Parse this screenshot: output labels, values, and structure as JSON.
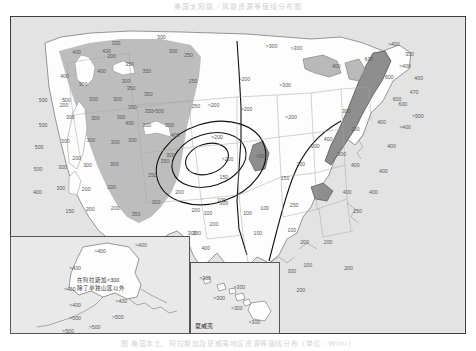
{
  "figure": {
    "title": "美国太阳能／风能资源等值线分布图",
    "caption": "图 美国本土、阿拉斯加及夏威夷地区资源等值线分布（单位：W/m²）",
    "domain_note": "contour map of the contiguous United States with Alaska and Hawaii insets"
  },
  "colors": {
    "ocean": "#e3e3e3",
    "land": "#fdfdfd",
    "shade_light": "#b9b9b9",
    "shade_dark": "#8e8e8e",
    "contour_line": "#1a1a1a",
    "border": "#3c3c3c",
    "state_line": "#9a9a9a",
    "label_text": "#5a5a5a"
  },
  "insets": {
    "alaska": {
      "name": "阿拉斯加",
      "note_line1": "在阿拉斯加<300",
      "note_line2": "除了单独山区以外",
      "labels": [
        {
          "t": ">400",
          "x": 0.5,
          "y": 0.16
        },
        {
          "t": ">400",
          "x": 0.73,
          "y": 0.09
        },
        {
          "t": ">400",
          "x": 0.36,
          "y": 0.33
        },
        {
          "t": ">400",
          "x": 0.33,
          "y": 0.55
        },
        {
          "t": ">400",
          "x": 0.36,
          "y": 0.72
        },
        {
          "t": ">400",
          "x": 0.62,
          "y": 0.68
        },
        {
          "t": ">500",
          "x": 0.36,
          "y": 0.85
        },
        {
          "t": ">500",
          "x": 0.6,
          "y": 0.84
        },
        {
          "t": ">500",
          "x": 0.47,
          "y": 0.95
        },
        {
          "t": ">500",
          "x": 0.32,
          "y": 0.99
        }
      ]
    },
    "hawaii": {
      "name": "夏威夷",
      "labels": [
        {
          "t": ">300",
          "x": 0.16,
          "y": 0.23
        },
        {
          "t": ">300",
          "x": 0.55,
          "y": 0.36
        },
        {
          "t": ">300",
          "x": 0.32,
          "y": 0.52
        },
        {
          "t": ">300",
          "x": 0.52,
          "y": 0.66
        },
        {
          "t": ">300",
          "x": 0.72,
          "y": 0.86
        }
      ]
    }
  },
  "chart_data": {
    "type": "contour-map",
    "title": "美国太阳能／风能资源等值线分布图",
    "unit": "W/m²",
    "region": "Contiguous United States, Alaska, Hawaii",
    "contour_levels": [
      100,
      150,
      200,
      250,
      300,
      350,
      400,
      500
    ],
    "legend_position": "none",
    "grid": false,
    "shaded_classes": [
      {
        "name": "western-mountain-shading",
        "fill": "#b9b9b9",
        "meaning": "western high-resource / mountain region"
      },
      {
        "name": "appalachian-shading",
        "fill": "#8e8e8e",
        "meaning": "Appalachian ridge high-resource band"
      },
      {
        "name": "great-lakes-shading",
        "fill": "#b9b9b9",
        "meaning": "Great Lakes shoreline band"
      }
    ],
    "contour_labels": [
      {
        "value": "400",
        "x": 0.145,
        "y": 0.115
      },
      {
        "value": "400",
        "x": 0.211,
        "y": 0.111
      },
      {
        "value": "400",
        "x": 0.118,
        "y": 0.192
      },
      {
        "value": "400",
        "x": 0.2,
        "y": 0.175
      },
      {
        "value": "300",
        "x": 0.159,
        "y": 0.217
      },
      {
        "value": "300",
        "x": 0.254,
        "y": 0.205
      },
      {
        "value": "500",
        "x": 0.071,
        "y": 0.268
      },
      {
        "value": "500",
        "x": 0.122,
        "y": 0.266
      },
      {
        "value": "300",
        "x": 0.182,
        "y": 0.262
      },
      {
        "value": "300",
        "x": 0.235,
        "y": 0.265
      },
      {
        "value": "500",
        "x": 0.071,
        "y": 0.345
      },
      {
        "value": "300",
        "x": 0.131,
        "y": 0.32
      },
      {
        "value": "300",
        "x": 0.186,
        "y": 0.323
      },
      {
        "value": "300",
        "x": 0.243,
        "y": 0.322
      },
      {
        "value": "500",
        "x": 0.062,
        "y": 0.417
      },
      {
        "value": "300",
        "x": 0.12,
        "y": 0.398
      },
      {
        "value": "300",
        "x": 0.176,
        "y": 0.394
      },
      {
        "value": "300",
        "x": 0.23,
        "y": 0.4
      },
      {
        "value": "500",
        "x": 0.06,
        "y": 0.487
      },
      {
        "value": "300",
        "x": 0.114,
        "y": 0.48
      },
      {
        "value": "300",
        "x": 0.169,
        "y": 0.472
      },
      {
        "value": "300",
        "x": 0.228,
        "y": 0.47
      },
      {
        "value": "400",
        "x": 0.058,
        "y": 0.56
      },
      {
        "value": "300",
        "x": 0.11,
        "y": 0.545
      },
      {
        "value": "200",
        "x": 0.166,
        "y": 0.548
      },
      {
        "value": "200",
        "x": 0.222,
        "y": 0.543
      },
      {
        "value": "150",
        "x": 0.13,
        "y": 0.62
      },
      {
        "value": "200",
        "x": 0.175,
        "y": 0.612
      },
      {
        "value": "200",
        "x": 0.23,
        "y": 0.61
      },
      {
        "value": "200",
        "x": 0.117,
        "y": 0.282
      },
      {
        "value": "200",
        "x": 0.145,
        "y": 0.452
      },
      {
        "value": "350",
        "x": 0.262,
        "y": 0.152
      },
      {
        "value": "350",
        "x": 0.3,
        "y": 0.175
      },
      {
        "value": "350",
        "x": 0.265,
        "y": 0.228
      },
      {
        "value": "350",
        "x": 0.303,
        "y": 0.247
      },
      {
        "value": "350",
        "x": 0.268,
        "y": 0.29
      },
      {
        "value": "350",
        "x": 0.305,
        "y": 0.3
      },
      {
        "value": "400",
        "x": 0.262,
        "y": 0.34
      },
      {
        "value": "300",
        "x": 0.3,
        "y": 0.345
      },
      {
        "value": "300",
        "x": 0.268,
        "y": 0.393
      },
      {
        "value": "350",
        "x": 0.276,
        "y": 0.63
      },
      {
        "value": "300",
        "x": 0.32,
        "y": 0.592
      },
      {
        "value": "250",
        "x": 0.312,
        "y": 0.505
      },
      {
        "value": "250",
        "x": 0.34,
        "y": 0.46
      },
      {
        "value": "300",
        "x": 0.358,
        "y": 0.11
      },
      {
        "value": "300",
        "x": 0.332,
        "y": 0.066
      },
      {
        "value": "250",
        "x": 0.392,
        "y": 0.125
      },
      {
        "value": "250",
        "x": 0.402,
        "y": 0.205
      },
      {
        "value": "250",
        "x": 0.408,
        "y": 0.285
      },
      {
        "value": ">500",
        "x": 0.325,
        "y": 0.3
      },
      {
        "value": "500",
        "x": 0.35,
        "y": 0.345
      },
      {
        "value": "400",
        "x": 0.363,
        "y": 0.378
      },
      {
        "value": "300",
        "x": 0.352,
        "y": 0.44
      },
      {
        "value": "200",
        "x": 0.372,
        "y": 0.56
      },
      {
        "value": "200",
        "x": 0.408,
        "y": 0.615
      },
      {
        "value": "300",
        "x": 0.4,
        "y": 0.69
      },
      {
        "value": "400",
        "x": 0.43,
        "y": 0.735
      },
      {
        "value": ">200",
        "x": 0.447,
        "y": 0.282
      },
      {
        "value": ">200",
        "x": 0.455,
        "y": 0.385
      },
      {
        "value": ">200",
        "x": 0.478,
        "y": 0.455
      },
      {
        "value": "150",
        "x": 0.47,
        "y": 0.51
      },
      {
        "value": "100",
        "x": 0.465,
        "y": 0.585
      },
      {
        "value": "100",
        "x": 0.435,
        "y": 0.625
      },
      {
        "value": "200",
        "x": 0.448,
        "y": 0.66
      },
      {
        "value": "200",
        "x": 0.41,
        "y": 0.69
      },
      {
        "value": "300",
        "x": 0.47,
        "y": 0.595
      },
      {
        "value": ">200",
        "x": 0.515,
        "y": 0.2
      },
      {
        "value": ">300",
        "x": 0.575,
        "y": 0.095
      },
      {
        "value": ">300",
        "x": 0.63,
        "y": 0.1
      },
      {
        "value": ">200",
        "x": 0.52,
        "y": 0.295
      },
      {
        "value": ">300",
        "x": 0.605,
        "y": 0.218
      },
      {
        "value": ">200",
        "x": 0.618,
        "y": 0.322
      },
      {
        "value": ">200",
        "x": 0.552,
        "y": 0.445
      },
      {
        "value": "150",
        "x": 0.605,
        "y": 0.515
      },
      {
        "value": "200",
        "x": 0.64,
        "y": 0.47
      },
      {
        "value": "200",
        "x": 0.672,
        "y": 0.412
      },
      {
        "value": "100",
        "x": 0.56,
        "y": 0.61
      },
      {
        "value": "100",
        "x": 0.522,
        "y": 0.625
      },
      {
        "value": "100",
        "x": 0.545,
        "y": 0.69
      },
      {
        "value": "250",
        "x": 0.625,
        "y": 0.6
      },
      {
        "value": "100",
        "x": 0.62,
        "y": 0.678
      },
      {
        "value": "200",
        "x": 0.648,
        "y": 0.718
      },
      {
        "value": "100",
        "x": 0.655,
        "y": 0.79
      },
      {
        "value": "300",
        "x": 0.62,
        "y": 0.81
      },
      {
        "value": "200",
        "x": 0.64,
        "y": 0.87
      },
      {
        "value": "200",
        "x": 0.7,
        "y": 0.718
      },
      {
        "value": "200",
        "x": 0.745,
        "y": 0.8
      },
      {
        "value": "400",
        "x": 0.718,
        "y": 0.16
      },
      {
        "value": "300",
        "x": 0.74,
        "y": 0.3
      },
      {
        "value": "300",
        "x": 0.76,
        "y": 0.36
      },
      {
        "value": "400",
        "x": 0.7,
        "y": 0.392
      },
      {
        "value": "300",
        "x": 0.73,
        "y": 0.438
      },
      {
        "value": "400",
        "x": 0.76,
        "y": 0.472
      },
      {
        "value": "400",
        "x": 0.742,
        "y": 0.56
      },
      {
        "value": "600",
        "x": 0.79,
        "y": 0.135
      },
      {
        "value": "600",
        "x": 0.835,
        "y": 0.195
      },
      {
        "value": "600",
        "x": 0.852,
        "y": 0.262
      },
      {
        "value": "400",
        "x": 0.818,
        "y": 0.335
      },
      {
        "value": "400",
        "x": 0.84,
        "y": 0.412
      },
      {
        "value": "400",
        "x": 0.822,
        "y": 0.492
      },
      {
        "value": "400",
        "x": 0.8,
        "y": 0.56
      },
      {
        "value": "250",
        "x": 0.765,
        "y": 0.62
      },
      {
        "value": ">400",
        "x": 0.845,
        "y": 0.088
      },
      {
        "value": "350",
        "x": 0.88,
        "y": 0.122
      },
      {
        "value": ">400",
        "x": 0.87,
        "y": 0.16
      },
      {
        "value": "470",
        "x": 0.89,
        "y": 0.242
      },
      {
        "value": "600",
        "x": 0.865,
        "y": 0.278
      },
      {
        "value": ">500",
        "x": 0.898,
        "y": 0.318
      },
      {
        "value": ">400",
        "x": 0.87,
        "y": 0.352
      },
      {
        "value": "400",
        "x": 0.9,
        "y": 0.198
      },
      {
        "value": "300",
        "x": 0.232,
        "y": 0.085
      },
      {
        "value": "200",
        "x": 0.222,
        "y": 0.128
      }
    ]
  }
}
